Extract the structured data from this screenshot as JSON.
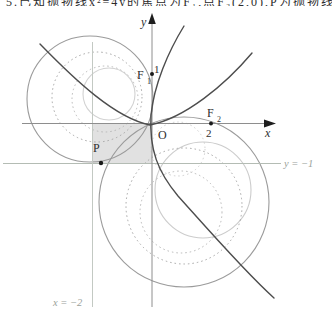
{
  "top_text": {
    "cropped_line": "5.已知抛物线x²=4y的焦点为F₁,点F₂(2,0),P为抛物线上一点,则下列结论正确"
  },
  "figure": {
    "background": "#ffffff",
    "region": {
      "name": "shaded-square",
      "x": 93,
      "y": 123.5,
      "w": 59,
      "h": 40,
      "fill": "#dadada",
      "opacity": 0.8
    },
    "circles": [
      {
        "name": "circle-upper-left-solid-large",
        "cx": 90,
        "cy": 99,
        "r": 63,
        "stroke": "#9b9b9b",
        "w": 1.1,
        "dash": ""
      },
      {
        "name": "circle-upper-left-dotted-medium",
        "cx": 97,
        "cy": 97,
        "r": 45,
        "stroke": "#a6a6a6",
        "w": 1,
        "dash": "1.5 3"
      },
      {
        "name": "circle-upper-left-dotted-small",
        "cx": 105,
        "cy": 99,
        "r": 33,
        "stroke": "#b8b8b8",
        "w": 1,
        "dash": "1.5 3"
      },
      {
        "name": "circle-upper-left-light-small",
        "cx": 109,
        "cy": 94,
        "r": 26,
        "stroke": "#d2d2d2",
        "w": 1.1,
        "dash": ""
      },
      {
        "name": "circle-lower-right-solid-large",
        "cx": 184,
        "cy": 202,
        "r": 85,
        "stroke": "#9b9b9b",
        "w": 1.1,
        "dash": ""
      },
      {
        "name": "circle-lower-right-light-medium",
        "cx": 203,
        "cy": 190,
        "r": 48,
        "stroke": "#cccccc",
        "w": 1.1,
        "dash": ""
      },
      {
        "name": "circle-lower-right-dotted-large",
        "cx": 184,
        "cy": 206,
        "r": 58,
        "stroke": "#a6a6a6",
        "w": 1,
        "dash": "1.5 3"
      },
      {
        "name": "circle-lower-right-dotted-medium",
        "cx": 181,
        "cy": 212,
        "r": 41,
        "stroke": "#b8b8b8",
        "w": 1,
        "dash": "1.5 3"
      },
      {
        "name": "circle-near-origin-dotted-small",
        "cx": 178,
        "cy": 149,
        "r": 27,
        "stroke": "#cfcfcf",
        "w": 1,
        "dash": "1.5 3"
      }
    ],
    "ref_lines": [
      {
        "name": "directrix-line",
        "x1": 3,
        "y1": 163.5,
        "x2": 281,
        "y2": 163.5,
        "stroke": "#b4bcb4",
        "w": 1
      },
      {
        "name": "vertical-line-x-neg2",
        "x1": 92.5,
        "y1": 42,
        "x2": 92.5,
        "y2": 307,
        "stroke": "#c3c9c3",
        "w": 1
      }
    ],
    "axes": {
      "x_axis": {
        "name": "x-axis",
        "x1": 22,
        "y1": 123.5,
        "x2": 268,
        "y2": 123.5,
        "stroke": "#8e8e8e",
        "w": 1
      },
      "y_axis": {
        "name": "y-axis",
        "x1": 152,
        "y1": 21,
        "x2": 152,
        "y2": 307,
        "stroke": "#8e8e8e",
        "w": 1
      },
      "x_arrow": {
        "name": "x-axis-arrow",
        "points": "276,123.5 264,119.6 264,127.4",
        "fill": "#1e1e1e"
      },
      "y_arrow": {
        "name": "y-axis-arrow",
        "points": "152,13 148.2,24 155.8,24",
        "fill": "#1e1e1e"
      }
    },
    "curves": [
      {
        "name": "parabola-curve",
        "d": "M 40 44 C 75 80 115 118 150 125 C 185 118 225 85 252 53",
        "stroke": "#4d4d4d",
        "w": 1.4
      },
      {
        "name": "hyperbola-branch-curve",
        "d": "M 184 26 C 168 52 154 85 151 115 C 149 150 158 172 178 196 C 205 226 245 272 274 298",
        "stroke": "#4d4d4d",
        "w": 1.4
      }
    ],
    "points": [
      {
        "name": "focus1-point",
        "cx": 152,
        "cy": 74,
        "r": 2,
        "fill": "#1a1a1a"
      },
      {
        "name": "focus2-point",
        "cx": 211,
        "cy": 123.5,
        "r": 2,
        "fill": "#1a1a1a"
      },
      {
        "name": "point-p",
        "cx": 101,
        "cy": 163,
        "r": 2.2,
        "fill": "#1a1a1a"
      }
    ],
    "labels": [
      {
        "name": "y-axis-label",
        "text": "y",
        "x": 141,
        "y": 26,
        "size": 12,
        "italic": true,
        "color": "#2e2e2e"
      },
      {
        "name": "x-axis-label",
        "text": "x",
        "x": 265,
        "y": 137,
        "size": 12,
        "italic": true,
        "color": "#2e2e2e"
      },
      {
        "name": "origin-label",
        "text": "O",
        "x": 158,
        "y": 139,
        "size": 12,
        "italic": false,
        "color": "#2e2e2e"
      },
      {
        "name": "focus1-label",
        "text": "F",
        "x": 137,
        "y": 79,
        "size": 12,
        "italic": false,
        "color": "#2e2e2e"
      },
      {
        "name": "focus1-label-sub",
        "text": "1",
        "x": 147,
        "y": 84,
        "size": 8,
        "italic": false,
        "color": "#2e2e2e"
      },
      {
        "name": "focus2-label",
        "text": "F",
        "x": 207,
        "y": 117,
        "size": 12,
        "italic": false,
        "color": "#2e2e2e"
      },
      {
        "name": "focus2-label-sub",
        "text": "2",
        "x": 217,
        "y": 122,
        "size": 8,
        "italic": false,
        "color": "#2e2e2e"
      },
      {
        "name": "tick-label-1",
        "text": "1",
        "x": 154,
        "y": 73,
        "size": 11,
        "italic": false,
        "color": "#2e2e2e"
      },
      {
        "name": "tick-label-2",
        "text": "2",
        "x": 206,
        "y": 137,
        "size": 11,
        "italic": false,
        "color": "#2e2e2e"
      },
      {
        "name": "point-p-label",
        "text": "P",
        "x": 93,
        "y": 152,
        "size": 12,
        "italic": false,
        "color": "#2e2e2e"
      },
      {
        "name": "directrix-label",
        "text": "y = −1",
        "x": 284,
        "y": 167,
        "size": 10.5,
        "italic": true,
        "color": "#9aa29a"
      },
      {
        "name": "vline-label",
        "text": "x = −2",
        "x": 53,
        "y": 306,
        "size": 10.5,
        "italic": true,
        "color": "#9aa29a"
      }
    ]
  }
}
